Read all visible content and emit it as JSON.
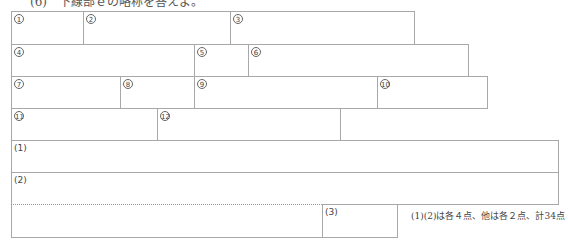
{
  "heading": "(6)　下線部ｅの略称を答えよ。",
  "answer_sheet": {
    "row1": [
      {
        "label": "1",
        "left": 11,
        "top": 11,
        "width": 73,
        "height": 34
      },
      {
        "label": "2",
        "left": 83,
        "top": 11,
        "width": 148,
        "height": 34
      },
      {
        "label": "3",
        "left": 230,
        "top": 11,
        "width": 185,
        "height": 34
      }
    ],
    "row2": [
      {
        "label": "4",
        "left": 11,
        "top": 44,
        "width": 184,
        "height": 33
      },
      {
        "label": "5",
        "left": 194,
        "top": 44,
        "width": 55,
        "height": 33
      },
      {
        "label": "6",
        "left": 248,
        "top": 44,
        "width": 221,
        "height": 33
      }
    ],
    "row3": [
      {
        "label": "7",
        "left": 11,
        "top": 76,
        "width": 110,
        "height": 33
      },
      {
        "label": "8",
        "left": 120,
        "top": 76,
        "width": 75,
        "height": 33
      },
      {
        "label": "9",
        "left": 194,
        "top": 76,
        "width": 184,
        "height": 33
      },
      {
        "label": "10",
        "left": 377,
        "top": 76,
        "width": 111,
        "height": 33
      }
    ],
    "row4": [
      {
        "label": "11",
        "left": 11,
        "top": 108,
        "width": 147,
        "height": 33
      },
      {
        "label": "12",
        "left": 157,
        "top": 108,
        "width": 184,
        "height": 33
      }
    ],
    "part2": [
      {
        "label": "(1)"
      },
      {
        "label": "(2)"
      },
      {
        "label": "(3)"
      }
    ]
  },
  "score_note": "(1)(2)は各４点、他は各２点、計34点"
}
